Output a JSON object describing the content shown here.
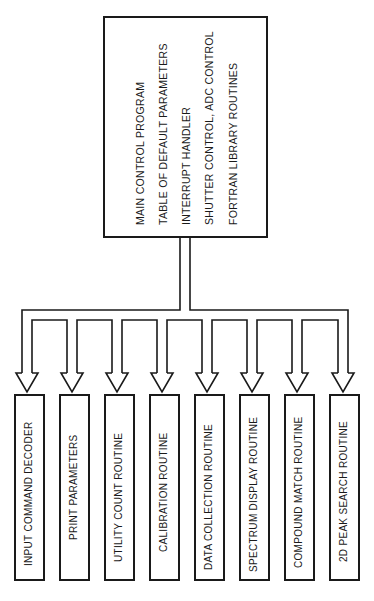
{
  "diagram": {
    "main_module": {
      "lines": [
        "MAIN CONTROL PROGRAM",
        "TABLE OF DEFAULT PARAMETERS",
        "INTERRUPT HANDLER",
        "SHUTTER CONTROL, ADC CONTROL",
        "FORTRAN LIBRARY ROUTINES"
      ]
    },
    "sub_modules": [
      {
        "label": "INPUT COMMAND DECODER"
      },
      {
        "label": "PRINT PARAMETERS"
      },
      {
        "label": "UTILITY COUNT ROUTINE"
      },
      {
        "label": "CALIBRATION ROUTINE"
      },
      {
        "label": "DATA COLLECTION ROUTINE"
      },
      {
        "label": "SPECTRUM DISPLAY ROUTINE"
      },
      {
        "label": "COMPOUND MATCH ROUTINE"
      },
      {
        "label": "2D PEAK SEARCH ROUTINE"
      }
    ],
    "colors": {
      "line": "#1a1a1a",
      "background": "#ffffff"
    }
  }
}
